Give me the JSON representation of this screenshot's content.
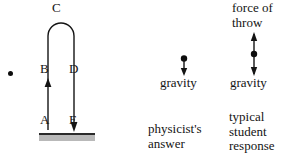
{
  "figure": {
    "stroke_color": "#141414",
    "ground_color": "#b9b9b9"
  },
  "trajectory": {
    "bullet": "•",
    "points": [
      {
        "id": "A",
        "label": "A",
        "role": "launch-point"
      },
      {
        "id": "B",
        "label": "B",
        "role": "rising-segment"
      },
      {
        "id": "C",
        "label": "C",
        "role": "apex-turnaround"
      },
      {
        "id": "D",
        "label": "D",
        "role": "falling-segment"
      },
      {
        "id": "E",
        "label": "E",
        "role": "landing-point"
      }
    ]
  },
  "physicist_panel": {
    "gravity_label": "gravity",
    "caption_line1": "physicist's",
    "caption_line2": "answer",
    "arrows": [
      {
        "name": "gravity-arrow",
        "direction": "down"
      }
    ]
  },
  "student_panel": {
    "force_throw_line1": "force of",
    "force_throw_line2": "throw",
    "gravity_label": "gravity",
    "caption_line1": "typical",
    "caption_line2": "student",
    "caption_line3": "response",
    "arrows": [
      {
        "name": "force-of-throw-arrow",
        "direction": "up"
      },
      {
        "name": "gravity-arrow",
        "direction": "down"
      }
    ]
  }
}
